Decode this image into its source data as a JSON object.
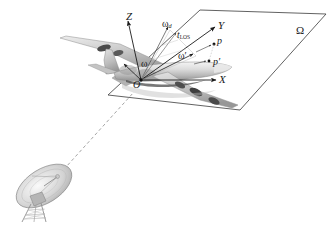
{
  "figure": {
    "background_color": "#ffffff",
    "ink_color": "#1a1a1a"
  },
  "plane": {
    "name": "image-projection-plane",
    "label": "Ω",
    "label_description": "capital-omega",
    "corners": "parallelogram"
  },
  "axes": [
    {
      "id": "x",
      "label": "X",
      "description": "x-axis arrow pointing right"
    },
    {
      "id": "y",
      "label": "Y",
      "description": "y-axis arrow pointing upper-right"
    },
    {
      "id": "z",
      "label": "Z",
      "description": "z-axis arrow pointing upper-left"
    }
  ],
  "origin": {
    "label": "O",
    "description": "body-frame origin at aircraft center"
  },
  "vectors": [
    {
      "id": "omega",
      "base": "ω",
      "sub": "",
      "description": "total angular rotation vector"
    },
    {
      "id": "omega-d",
      "base": "ω",
      "sub": "d",
      "description": "angular velocity component along line of sight"
    },
    {
      "id": "omega-prime",
      "base": "ω",
      "sub": "",
      "prime": "′",
      "description": "effective rotation vector in projection plane"
    },
    {
      "id": "t-los",
      "base": "t",
      "sub": "LOS",
      "description": "unit line-of-sight vector"
    }
  ],
  "points": [
    {
      "id": "p",
      "label": "p",
      "description": "scatterer point on aircraft"
    },
    {
      "id": "p-prime",
      "label": "p′",
      "description": "projection of scatterer onto image plane"
    }
  ],
  "target": {
    "name": "aircraft",
    "description": "large four-engine swept-wing jet aircraft rendered in grey, straddling the projection plane"
  },
  "radar": {
    "name": "ground-radar-antenna",
    "description": "parabolic dish antenna on a lattice pedestal at lower left"
  },
  "line_of_sight": {
    "name": "line-of-sight-ray",
    "style": "dashed",
    "description": "dashed ray from the radar dish up to the aircraft target"
  }
}
